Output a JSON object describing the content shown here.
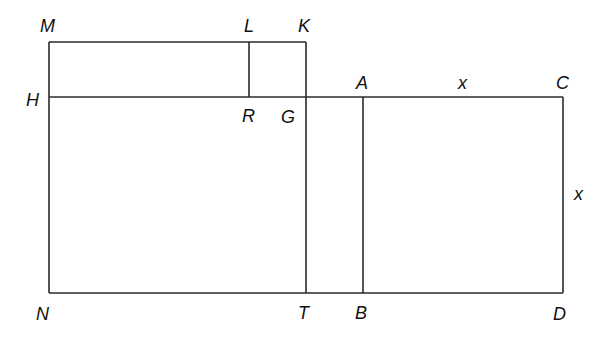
{
  "diagram": {
    "title": "",
    "points": {
      "M": {
        "label": "M",
        "x": 49,
        "y": 42
      },
      "L": {
        "label": "L",
        "x": 249,
        "y": 42
      },
      "K": {
        "label": "K",
        "x": 306,
        "y": 42
      },
      "H": {
        "label": "H",
        "x": 49,
        "y": 97
      },
      "R": {
        "label": "R",
        "x": 249,
        "y": 97
      },
      "G": {
        "label": "G",
        "x": 306,
        "y": 97
      },
      "A": {
        "label": "A",
        "x": 363,
        "y": 97
      },
      "C": {
        "label": "C",
        "x": 563,
        "y": 97
      },
      "N": {
        "label": "N",
        "x": 49,
        "y": 293
      },
      "T": {
        "label": "T",
        "x": 306,
        "y": 293
      },
      "B": {
        "label": "B",
        "x": 363,
        "y": 293
      },
      "D": {
        "label": "D",
        "x": 563,
        "y": 293
      }
    },
    "segments": [
      [
        "M",
        "K"
      ],
      [
        "M",
        "N"
      ],
      [
        "K",
        "T"
      ],
      [
        "L",
        "R"
      ],
      [
        "H",
        "C"
      ],
      [
        "N",
        "D"
      ],
      [
        "A",
        "B"
      ],
      [
        "C",
        "D"
      ]
    ],
    "side_labels": {
      "top": "x",
      "right": "x"
    }
  }
}
